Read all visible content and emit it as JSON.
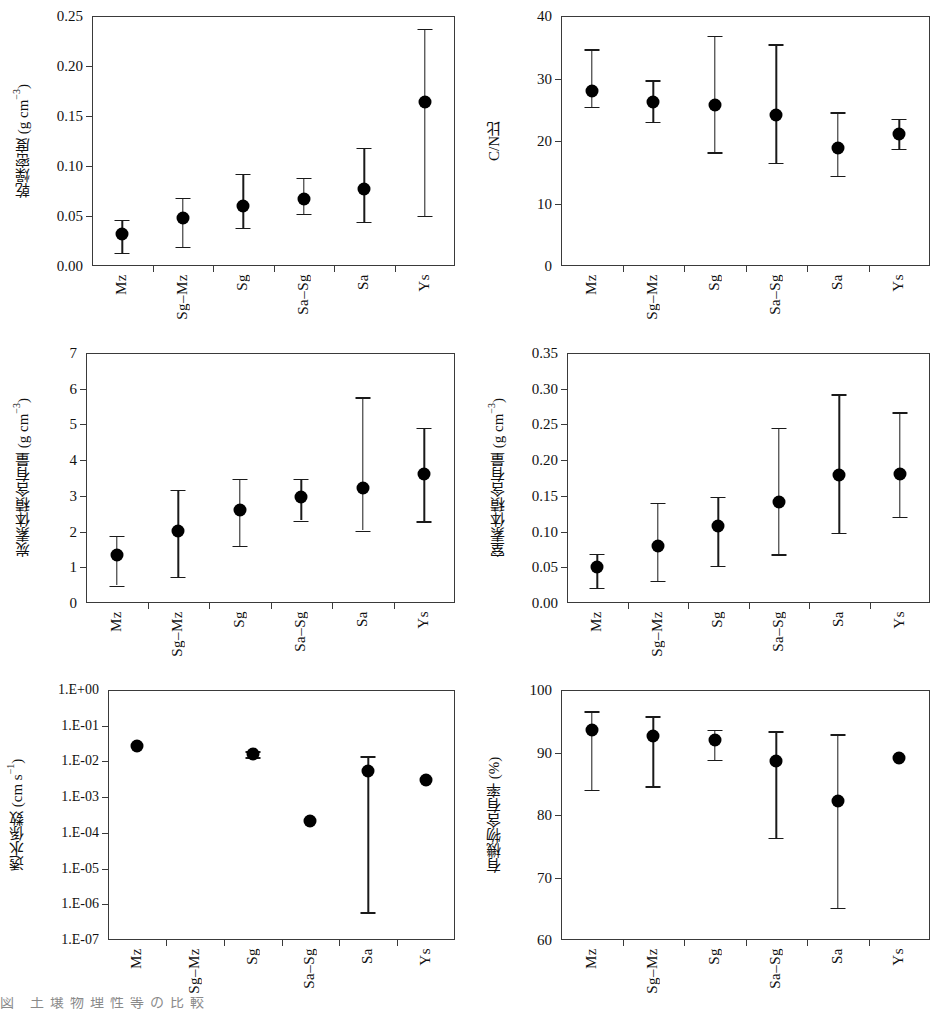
{
  "figure": {
    "categories": [
      "Mz",
      "Sg–Mz",
      "Sg",
      "Sa–Sg",
      "Sa",
      "Ys"
    ],
    "panel_count": 6,
    "marker_style": "filled-circle",
    "error_bar_style": "capped-vertical",
    "frame_color": "#3a3a3a",
    "marker_color": "#000000"
  },
  "chart_data": [
    {
      "type": "scatter",
      "panel": "top-left",
      "title": "",
      "xlabel": "",
      "ylabel": "乾燥密度 (g cm⁻³)",
      "ylabel_main": "乾燥密度 (g cm",
      "ylabel_sup": "−3",
      "ylabel_tail": ")",
      "categories": [
        "Mz",
        "Sg–Mz",
        "Sg",
        "Sa–Sg",
        "Sa",
        "Ys"
      ],
      "values": [
        0.032,
        0.048,
        0.06,
        0.067,
        0.077,
        0.164
      ],
      "err_low": [
        0.013,
        0.019,
        0.038,
        0.052,
        0.044,
        0.05
      ],
      "err_high": [
        0.046,
        0.068,
        0.092,
        0.088,
        0.118,
        0.237
      ],
      "ylim": [
        0.0,
        0.25
      ],
      "yticks": [
        0.0,
        0.05,
        0.1,
        0.15,
        0.2,
        0.25
      ],
      "ytick_labels": [
        "0.00",
        "0.05",
        "0.10",
        "0.15",
        "0.20",
        "0.25"
      ],
      "grid": false,
      "legend": "none",
      "scale": "linear"
    },
    {
      "type": "scatter",
      "panel": "top-right",
      "title": "",
      "xlabel": "",
      "ylabel": "C/N比",
      "ylabel_main": "C/N比",
      "ylabel_sup": "",
      "ylabel_tail": "",
      "categories": [
        "Mz",
        "Sg–Mz",
        "Sg",
        "Sa–Sg",
        "Sa",
        "Ys"
      ],
      "values": [
        28.0,
        26.2,
        25.8,
        24.1,
        18.9,
        21.2
      ],
      "err_low": [
        25.5,
        23.1,
        18.2,
        16.5,
        14.4,
        18.8
      ],
      "err_high": [
        34.7,
        29.7,
        36.8,
        35.5,
        24.6,
        23.6
      ],
      "ylim": [
        0,
        40
      ],
      "yticks": [
        0,
        10,
        20,
        30,
        40
      ],
      "ytick_labels": [
        "0",
        "10",
        "20",
        "30",
        "40"
      ],
      "grid": false,
      "legend": "none",
      "scale": "linear"
    },
    {
      "type": "scatter",
      "panel": "middle-left",
      "title": "",
      "xlabel": "",
      "ylabel": "炭素体積含有量 (g cm⁻³)",
      "ylabel_main": "炭素体積含有量 (g cm",
      "ylabel_sup": "−3",
      "ylabel_tail": ")",
      "categories": [
        "Mz",
        "Sg–Mz",
        "Sg",
        "Sa–Sg",
        "Sa",
        "Ys"
      ],
      "values": [
        1.35,
        2.03,
        2.61,
        2.98,
        3.23,
        3.61
      ],
      "err_low": [
        0.49,
        0.74,
        1.6,
        2.31,
        2.03,
        2.29
      ],
      "err_high": [
        1.88,
        3.17,
        3.48,
        3.47,
        5.76,
        4.9
      ],
      "ylim": [
        0,
        7
      ],
      "yticks": [
        0,
        1,
        2,
        3,
        4,
        5,
        6,
        7
      ],
      "ytick_labels": [
        "0",
        "1",
        "2",
        "3",
        "4",
        "5",
        "6",
        "7"
      ],
      "grid": false,
      "legend": "none",
      "scale": "linear"
    },
    {
      "type": "scatter",
      "panel": "middle-right",
      "title": "",
      "xlabel": "",
      "ylabel": "窒素体積含有量 (g cm⁻³)",
      "ylabel_main": "窒素体積含有量 (g cm",
      "ylabel_sup": "−3",
      "ylabel_tail": ")",
      "categories": [
        "Mz",
        "Sg–Mz",
        "Sg",
        "Sa–Sg",
        "Sa",
        "Ys"
      ],
      "values": [
        0.051,
        0.08,
        0.108,
        0.141,
        0.179,
        0.18
      ],
      "err_low": [
        0.021,
        0.031,
        0.052,
        0.068,
        0.098,
        0.121
      ],
      "err_high": [
        0.069,
        0.14,
        0.149,
        0.245,
        0.292,
        0.267
      ],
      "ylim": [
        0.0,
        0.35
      ],
      "yticks": [
        0.0,
        0.05,
        0.1,
        0.15,
        0.2,
        0.25,
        0.3,
        0.35
      ],
      "ytick_labels": [
        "0.00",
        "0.05",
        "0.10",
        "0.15",
        "0.20",
        "0.25",
        "0.30",
        "0.35"
      ],
      "grid": false,
      "legend": "none",
      "scale": "linear"
    },
    {
      "type": "scatter",
      "panel": "bottom-left",
      "title": "",
      "xlabel": "",
      "ylabel": "透水係数 (cm s⁻¹)",
      "ylabel_main": "透水係数 (cm s",
      "ylabel_sup": "−1",
      "ylabel_tail": ")",
      "categories": [
        "Mz",
        "Sg–Mz",
        "Sg",
        "Sa–Sg",
        "Sa",
        "Ys"
      ],
      "values": [
        0.027,
        null,
        0.016,
        0.00022,
        0.0053,
        0.003
      ],
      "err_low": [
        null,
        null,
        0.013,
        null,
        6e-07,
        null
      ],
      "err_high": [
        null,
        null,
        0.019,
        null,
        0.014,
        null
      ],
      "ylim": [
        1e-07,
        1.0
      ],
      "yticks": [
        1.0,
        0.1,
        0.01,
        0.001,
        0.0001,
        1e-05,
        1e-06,
        1e-07
      ],
      "ytick_labels": [
        "1.E+00",
        "1.E-01",
        "1.E-02",
        "1.E-03",
        "1.E-04",
        "1.E-05",
        "1.E-06",
        "1.E-07"
      ],
      "grid": false,
      "legend": "none",
      "scale": "log"
    },
    {
      "type": "scatter",
      "panel": "bottom-right",
      "title": "",
      "xlabel": "",
      "ylabel": "有機物含有率 (%)",
      "ylabel_main": "有機物含有率 (%)",
      "ylabel_sup": "",
      "ylabel_tail": "",
      "categories": [
        "Mz",
        "Sg–Mz",
        "Sg",
        "Sa–Sg",
        "Sa",
        "Ys"
      ],
      "values": [
        93.6,
        92.6,
        92.0,
        88.6,
        82.2,
        89.1
      ],
      "err_low": [
        84.0,
        84.6,
        88.8,
        76.4,
        65.2,
        null
      ],
      "err_high": [
        96.6,
        95.8,
        93.6,
        93.4,
        92.9,
        null
      ],
      "ylim": [
        60,
        100
      ],
      "yticks": [
        60,
        70,
        80,
        90,
        100
      ],
      "ytick_labels": [
        "60",
        "70",
        "80",
        "90",
        "100"
      ],
      "grid": false,
      "legend": "none",
      "scale": "linear"
    }
  ],
  "bottom_cropped_text": "図  土壌物理性等の比較"
}
